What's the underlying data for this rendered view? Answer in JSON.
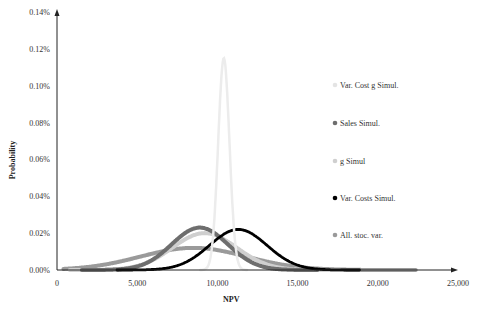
{
  "chart_data": {
    "type": "line",
    "title": "",
    "xlabel": "NPV",
    "ylabel": "Probability",
    "xlim": [
      0,
      25000
    ],
    "ylim": [
      0,
      0.0014
    ],
    "x_ticks": [
      "0",
      "5,000",
      "10,000",
      "15,000",
      "20,000",
      "25,000"
    ],
    "y_ticks": [
      "0.00%",
      "0.02%",
      "0.04%",
      "0.06%",
      "0.08%",
      "0.10%",
      "0.12%",
      "0.14%"
    ],
    "grid": false,
    "legend_position": "right",
    "series": [
      {
        "name": "Var. Cost g Simul.",
        "color": "#ececec",
        "mean": 10400,
        "sd": 350,
        "peak": 0.00115
      },
      {
        "name": "Sales Simul.",
        "color": "#6e6e6e",
        "mean": 8900,
        "sd": 1750,
        "peak": 0.00023
      },
      {
        "name": "g Simul",
        "color": "#cfcfcf",
        "mean": 9200,
        "sd": 2000,
        "peak": 0.0002
      },
      {
        "name": "Var. Costs Simul.",
        "color": "#000000",
        "mean": 11300,
        "sd": 1800,
        "peak": 0.00022
      },
      {
        "name": "All. stoc. var.",
        "color": "#9a9a9a",
        "mean": 8500,
        "sd": 3300,
        "peak": 0.00012
      }
    ]
  },
  "axis": {
    "xlabel": "NPV",
    "ylabel": "Probability",
    "x_ticks": [
      "0",
      "5,000",
      "10,000",
      "15,000",
      "20,000",
      "25,000"
    ],
    "y_ticks": [
      "0.00%",
      "0.02%",
      "0.04%",
      "0.06%",
      "0.08%",
      "0.10%",
      "0.12%",
      "0.14%"
    ]
  },
  "legend": [
    {
      "label": "Var. Cost g Simul.",
      "color": "#e4e4e4"
    },
    {
      "label": "Sales Simul.",
      "color": "#6e6e6e"
    },
    {
      "label": "g Simul",
      "color": "#cfcfcf"
    },
    {
      "label": "Var. Costs Simul.",
      "color": "#000000"
    },
    {
      "label": "All. stoc. var.",
      "color": "#9a9a9a"
    }
  ]
}
